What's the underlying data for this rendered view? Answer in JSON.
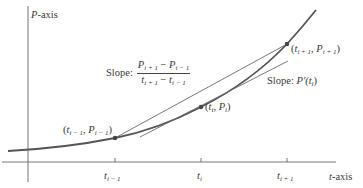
{
  "axes": {
    "y_label_var": "P",
    "y_label_suffix": "-axis",
    "x_label_var": "t",
    "x_label_suffix": "-axis"
  },
  "ticks": [
    {
      "var": "t",
      "sub": "i − 1"
    },
    {
      "var": "t",
      "sub": "i"
    },
    {
      "var": "t",
      "sub": "i + 1"
    }
  ],
  "points": [
    {
      "open": "(",
      "t": "t",
      "t_sub": "i − 1",
      "sep": ", ",
      "p": "P",
      "p_sub": "i − 1",
      "close": ")"
    },
    {
      "open": "(",
      "t": "t",
      "t_sub": "i",
      "sep": ", ",
      "p": "P",
      "p_sub": "i",
      "close": ")"
    },
    {
      "open": "(",
      "t": "t",
      "t_sub": "i + 1",
      "sep": ", ",
      "p": "P",
      "p_sub": "i + 1",
      "close": ")"
    }
  ],
  "secant_label": {
    "prefix": "Slope:",
    "num_a": "P",
    "num_a_sub": "i + 1",
    "num_minus": " − ",
    "num_b": "P",
    "num_b_sub": "i − 1",
    "den_a": "t",
    "den_a_sub": "i + 1",
    "den_minus": " − ",
    "den_b": "t",
    "den_b_sub": "i − 1"
  },
  "tangent_label": {
    "prefix": "Slope: ",
    "func": "P′(",
    "var": "t",
    "var_sub": "i",
    "close": ")"
  },
  "colors": {
    "curve": "#555555",
    "lines": "#6a6a6a",
    "axis": "#777777",
    "text": "#3a3a3a"
  }
}
